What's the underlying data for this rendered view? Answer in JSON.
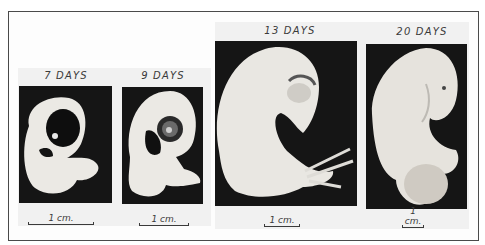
{
  "figure": {
    "panels": [
      {
        "label": "7 DAYS",
        "scale": "1 cm."
      },
      {
        "label": "9 DAYS",
        "scale": "1 cm."
      },
      {
        "label": "13 DAYS",
        "scale": "1 cm."
      },
      {
        "label": "20 DAYS",
        "scale": "1 cm."
      }
    ]
  },
  "colors": {
    "background": "#ffffff",
    "photo_background": "#151515",
    "embryo": "#ebe9e4",
    "text": "#3a3a3a"
  }
}
